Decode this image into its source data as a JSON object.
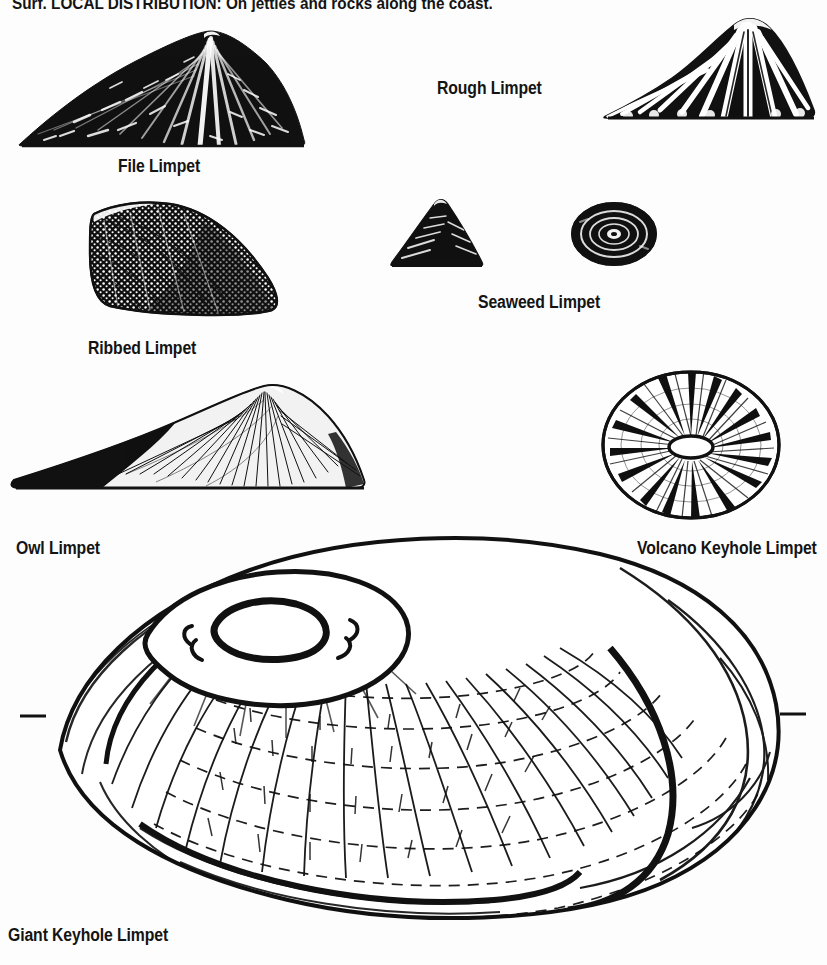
{
  "page": {
    "background_color": "#ffffff",
    "ink_color": "#141414",
    "top_text": "Surf. LOCAL DISTRIBUTION: On jetties and rocks along the coast."
  },
  "figures": [
    {
      "id": "file-limpet",
      "label": "File Limpet",
      "view": "side profile",
      "style": "solid dark dome with radial hatching, apex right of center"
    },
    {
      "id": "rough-limpet",
      "label": "Rough Limpet",
      "view": "side profile",
      "style": "ribbed dome with white radial ridges"
    },
    {
      "id": "ribbed-limpet",
      "label": "Ribbed Limpet",
      "view": "side profile",
      "style": "stippled wedge shell with concentric texture"
    },
    {
      "id": "seaweed-limpet",
      "label": "Seaweed Limpet",
      "view": "side profile and top view",
      "style": "small dark cone beside small oval top view"
    },
    {
      "id": "owl-limpet",
      "label": "Owl Limpet",
      "view": "side profile",
      "style": "wide low dome with fine radial hatching"
    },
    {
      "id": "volcano-keyhole-limpet",
      "label": "Volcano Keyhole Limpet",
      "view": "top view",
      "style": "oval shell with radial rays and central keyhole"
    },
    {
      "id": "giant-keyhole-limpet",
      "label": "Giant Keyhole Limpet",
      "view": "top view",
      "style": "large outline shell with dashed grid texture and central keyhole"
    }
  ]
}
